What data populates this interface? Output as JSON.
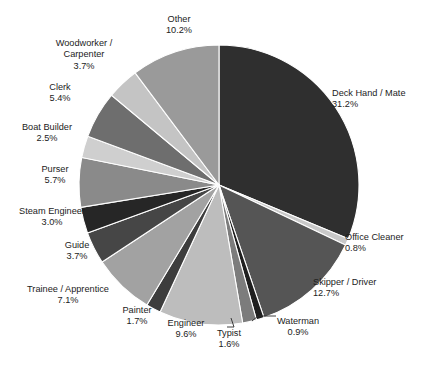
{
  "chart": {
    "title": "",
    "type": "pie"
  },
  "chart_data": {
    "type": "pie",
    "title": "",
    "subtitle": "",
    "xlabel": "",
    "ylabel": "",
    "units": "percent",
    "legend_position": "none",
    "grid": false,
    "labels_show_percent": true,
    "start_angle_deg": 0,
    "direction": "clockwise",
    "categories": [
      "Deck Hand / Mate",
      "Office Cleaner",
      "Skipper / Driver",
      "Waterman",
      "Typist",
      "Engineer",
      "Painter",
      "Trainee / Apprentice",
      "Guide",
      "Steam Engineer",
      "Purser",
      "Boat Builder",
      "Clerk",
      "Woodworker / Carpenter",
      "Other"
    ],
    "values": [
      31.2,
      0.8,
      12.7,
      0.9,
      1.6,
      9.6,
      1.7,
      7.1,
      3.7,
      3.0,
      5.7,
      2.5,
      5.4,
      3.7,
      10.2
    ],
    "colors": [
      "#2f2f2f",
      "#c9c9c9",
      "#555555",
      "#1f1f1f",
      "#7c7c7c",
      "#bdbdbd",
      "#3d3d3d",
      "#a2a2a2",
      "#464646",
      "#262626",
      "#8a8a8a",
      "#cfcfcf",
      "#6e6e6e",
      "#c4c4c4",
      "#9a9a9a"
    ],
    "slices": [
      {
        "label": "Deck Hand / Mate",
        "value": 31.2,
        "percent_text": "31.2%",
        "color": "#2f2f2f"
      },
      {
        "label": "Office Cleaner",
        "value": 0.8,
        "percent_text": "0.8%",
        "color": "#c9c9c9"
      },
      {
        "label": "Skipper / Driver",
        "value": 12.7,
        "percent_text": "12.7%",
        "color": "#555555"
      },
      {
        "label": "Waterman",
        "value": 0.9,
        "percent_text": "0.9%",
        "color": "#1f1f1f"
      },
      {
        "label": "Typist",
        "value": 1.6,
        "percent_text": "1.6%",
        "color": "#7c7c7c"
      },
      {
        "label": "Engineer",
        "value": 9.6,
        "percent_text": "9.6%",
        "color": "#bdbdbd"
      },
      {
        "label": "Painter",
        "value": 1.7,
        "percent_text": "1.7%",
        "color": "#3d3d3d"
      },
      {
        "label": "Trainee / Apprentice",
        "value": 7.1,
        "percent_text": "7.1%",
        "color": "#a2a2a2"
      },
      {
        "label": "Guide",
        "value": 3.7,
        "percent_text": "3.7%",
        "color": "#464646"
      },
      {
        "label": "Steam Engineer",
        "value": 3.0,
        "percent_text": "3.0%",
        "color": "#262626"
      },
      {
        "label": "Purser",
        "value": 5.7,
        "percent_text": "5.7%",
        "color": "#8a8a8a"
      },
      {
        "label": "Boat Builder",
        "value": 2.5,
        "percent_text": "2.5%",
        "color": "#cfcfcf"
      },
      {
        "label": "Clerk",
        "value": 5.4,
        "percent_text": "5.4%",
        "color": "#6e6e6e"
      },
      {
        "label": "Woodworker / Carpenter",
        "value": 3.7,
        "percent_text": "3.7%",
        "color": "#c4c4c4"
      },
      {
        "label": "Other",
        "value": 10.2,
        "percent_text": "10.2%",
        "color": "#9a9a9a"
      }
    ]
  },
  "labels": [
    {
      "name": "Deck Hand / Mate",
      "percent": "31.2%",
      "x": 332,
      "y": 88,
      "w": 90,
      "align": "left"
    },
    {
      "name": "Office Cleaner",
      "percent": "0.8%",
      "x": 345,
      "y": 232,
      "w": 78,
      "align": "left"
    },
    {
      "name": "Skipper / Driver",
      "percent": "12.7%",
      "x": 313,
      "y": 277,
      "w": 82,
      "align": "left"
    },
    {
      "name": "Waterman",
      "percent": "0.9%",
      "x": 268,
      "y": 316,
      "w": 60,
      "align": "center"
    },
    {
      "name": "Typist",
      "percent": "1.6%",
      "x": 208,
      "y": 328,
      "w": 42,
      "align": "center"
    },
    {
      "name": "Engineer",
      "percent": "9.6%",
      "x": 160,
      "y": 318,
      "w": 52,
      "align": "center"
    },
    {
      "name": "Painter",
      "percent": "1.7%",
      "x": 114,
      "y": 305,
      "w": 46,
      "align": "center"
    },
    {
      "name": "Trainee / Apprentice",
      "percent": "7.1%",
      "x": 20,
      "y": 284,
      "w": 96,
      "align": "center"
    },
    {
      "name": "Guide",
      "percent": "3.7%",
      "x": 55,
      "y": 240,
      "w": 44,
      "align": "center"
    },
    {
      "name": "Steam Engineer",
      "percent": "3.0%",
      "x": 8,
      "y": 206,
      "w": 88,
      "align": "center"
    },
    {
      "name": "Purser",
      "percent": "5.7%",
      "x": 30,
      "y": 164,
      "w": 50,
      "align": "center"
    },
    {
      "name": "Boat Builder",
      "percent": "2.5%",
      "x": 14,
      "y": 122,
      "w": 66,
      "align": "center"
    },
    {
      "name": "Clerk",
      "percent": "5.4%",
      "x": 38,
      "y": 82,
      "w": 44,
      "align": "center"
    },
    {
      "name": "Woodworker / Carpenter",
      "percent": "3.7%",
      "x": 46,
      "y": 38,
      "w": 76,
      "align": "center"
    },
    {
      "name": "Other",
      "percent": "10.2%",
      "x": 152,
      "y": 14,
      "w": 54,
      "align": "center"
    }
  ],
  "geometry": {
    "cx": 219,
    "cy": 185,
    "r": 140
  }
}
